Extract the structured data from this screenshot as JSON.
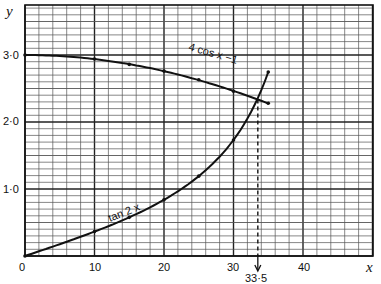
{
  "chart_data": {
    "type": "line",
    "title": "",
    "xlabel": "x",
    "ylabel": "y",
    "xlim": [
      0,
      50
    ],
    "ylim": [
      0,
      3.75
    ],
    "grid": true,
    "x_ticks": [
      "0",
      "10",
      "20",
      "30",
      "40"
    ],
    "y_ticks": [
      "1·0",
      "2·0",
      "3·0"
    ],
    "series": [
      {
        "name": "4 cos x - 1",
        "label": "4 cos x −1",
        "x": [
          0,
          10,
          15,
          20,
          25,
          30,
          35
        ],
        "values": [
          3.0,
          2.94,
          2.86,
          2.76,
          2.63,
          2.46,
          2.28
        ]
      },
      {
        "name": "tan 2x",
        "label": "tan 2x",
        "x": [
          0,
          10,
          15,
          20,
          25,
          30,
          33.5,
          35
        ],
        "values": [
          0,
          0.364,
          0.577,
          0.839,
          1.192,
          1.732,
          2.35,
          2.747
        ]
      }
    ],
    "annotations": [
      {
        "type": "dashed-vertical",
        "x": 33.5,
        "label": "33·5",
        "arrow": "down"
      }
    ]
  },
  "labels": {
    "x_axis": "x",
    "y_axis": "y",
    "x_ticks": [
      "0",
      "10",
      "20",
      "30",
      "40"
    ],
    "y_ticks": [
      "3·0",
      "2·0",
      "1·0"
    ],
    "cos_label": "4 cos x −1",
    "tan_label": "tan 2 x",
    "intersection_label": "33·5"
  }
}
